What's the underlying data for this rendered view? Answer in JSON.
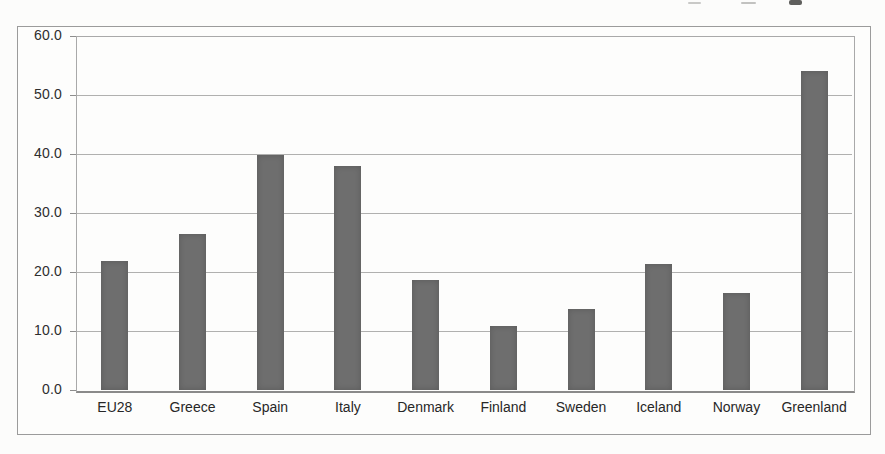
{
  "scan_artifacts": {
    "top_edge_cutoff_text": true,
    "fragments": [
      {
        "x": 688,
        "y": 2,
        "w": 13,
        "h": 2,
        "color": "#c9c9c7"
      },
      {
        "x": 741,
        "y": 2,
        "w": 15,
        "h": 2,
        "color": "#c2c2c0"
      },
      {
        "x": 789,
        "y": 0,
        "w": 13,
        "h": 5,
        "color": "#5f5f5d"
      }
    ]
  },
  "chart_data": {
    "type": "bar",
    "title": "",
    "xlabel": "",
    "ylabel": "",
    "categories": [
      "EU28",
      "Greece",
      "Spain",
      "Italy",
      "Denmark",
      "Finland",
      "Sweden",
      "Iceland",
      "Norway",
      "Greenland"
    ],
    "values": [
      21.9,
      26.4,
      39.8,
      37.9,
      18.6,
      10.8,
      13.7,
      21.4,
      16.5,
      54.0
    ],
    "ylim": [
      0,
      60
    ],
    "ytick_step": 10,
    "ytick_labels": [
      "0.0",
      "10.0",
      "20.0",
      "30.0",
      "40.0",
      "50.0",
      "60.0"
    ],
    "grid": true,
    "legend": false,
    "bar_color": "#6e6e6e",
    "gridline_color": "#b0b0af",
    "frame_color": "#9b9b9b",
    "text_color": "#2e2e2e"
  }
}
